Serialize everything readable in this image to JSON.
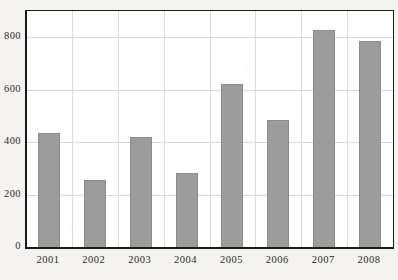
{
  "chart_data": {
    "type": "bar",
    "title": "",
    "subtitle": "",
    "xlabel": "",
    "ylabel": "",
    "categories": [
      "2001",
      "2002",
      "2003",
      "2004",
      "2005",
      "2006",
      "2007",
      "2008"
    ],
    "values": [
      435,
      255,
      418,
      282,
      622,
      485,
      828,
      785
    ],
    "series": [
      {
        "name": "",
        "values": [
          435,
          255,
          418,
          282,
          622,
          485,
          828,
          785
        ]
      }
    ],
    "ylim": [
      0,
      900
    ],
    "yticks": [
      0,
      200,
      400,
      600,
      800
    ],
    "ytick_labels": [
      "0",
      "200",
      "400",
      "600",
      "800"
    ],
    "xtick_labels": [
      "2001",
      "2002",
      "2003",
      "2004",
      "2005",
      "2006",
      "2007",
      "2008"
    ],
    "grid": "both",
    "legend": "none",
    "bar_color": "#9c9c9c",
    "bar_edge_color": "#8b8b8b",
    "plot_background": "#ffffff",
    "page_background": "#f4f3f0",
    "axis_color": "#1a1a1a",
    "gridline_color": "#d6d6d6",
    "bar_width_ratio": 0.48
  }
}
